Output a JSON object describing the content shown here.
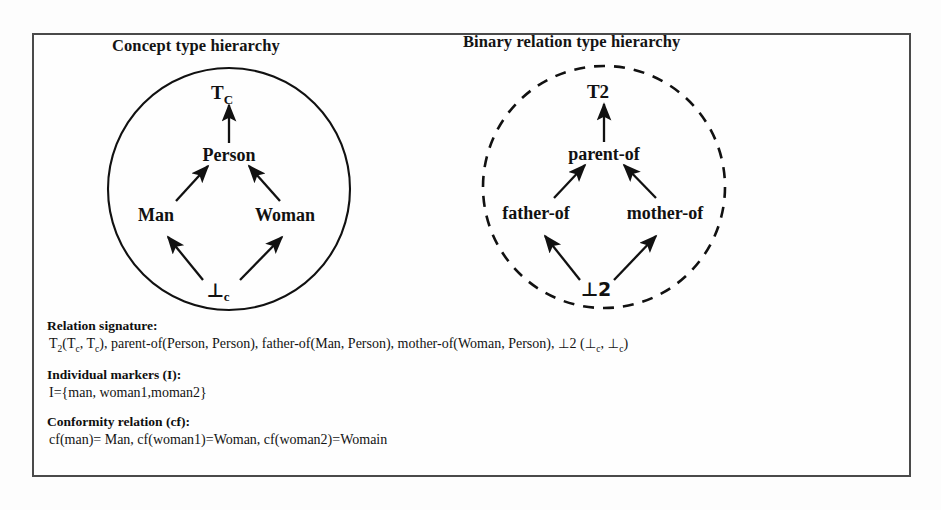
{
  "figure": {
    "border_color": "#4a4a4a",
    "background": "#fdfdfd",
    "ink_color": "#111111"
  },
  "panels": [
    {
      "id": "concept",
      "title": "Concept type hierarchy",
      "circle_style": "solid",
      "nodes": [
        {
          "id": "top",
          "label": "T",
          "subscript": "C"
        },
        {
          "id": "person",
          "label": "Person",
          "subscript": ""
        },
        {
          "id": "man",
          "label": "Man",
          "subscript": ""
        },
        {
          "id": "woman",
          "label": "Woman",
          "subscript": ""
        },
        {
          "id": "bottom",
          "label": "⊥",
          "subscript": "c"
        }
      ],
      "edges": [
        {
          "from": "person",
          "to": "top"
        },
        {
          "from": "man",
          "to": "person"
        },
        {
          "from": "woman",
          "to": "person"
        },
        {
          "from": "bottom",
          "to": "man"
        },
        {
          "from": "bottom",
          "to": "woman"
        }
      ]
    },
    {
      "id": "binary",
      "title": "Binary relation type hierarchy",
      "circle_style": "dashed",
      "nodes": [
        {
          "id": "top",
          "label": "T2",
          "subscript": ""
        },
        {
          "id": "parentof",
          "label": "parent-of",
          "subscript": ""
        },
        {
          "id": "fatherof",
          "label": "father-of",
          "subscript": ""
        },
        {
          "id": "motherof",
          "label": "mother-of",
          "subscript": ""
        },
        {
          "id": "bottom",
          "label": "⊥2",
          "subscript": ""
        }
      ],
      "edges": [
        {
          "from": "parentof",
          "to": "top"
        },
        {
          "from": "fatherof",
          "to": "parentof"
        },
        {
          "from": "motherof",
          "to": "parentof"
        },
        {
          "from": "bottom",
          "to": "fatherof"
        },
        {
          "from": "bottom",
          "to": "motherof"
        }
      ]
    }
  ],
  "text_block": {
    "relation_signature_heading": "Relation signature:",
    "relation_signature_body_html": "T<sub>2</sub>(T<sub>c</sub>, T<sub>c</sub>), parent-of(Person, Person), father-of(Man, Person), mother-of(Woman, Person), <span class=\"perp\">⊥</span>2 (<span class=\"perp\">⊥</span><sub>c</sub>, <span class=\"perp\">⊥</span><sub>c</sub>)",
    "individual_markers_heading": "Individual markers (I):",
    "individual_markers_body": "I={man, woman1,moman2}",
    "conformity_heading": "Conformity relation (cf):",
    "conformity_body": " cf(man)= Man, cf(woman1)=Woman, cf(woman2)=Womain"
  }
}
